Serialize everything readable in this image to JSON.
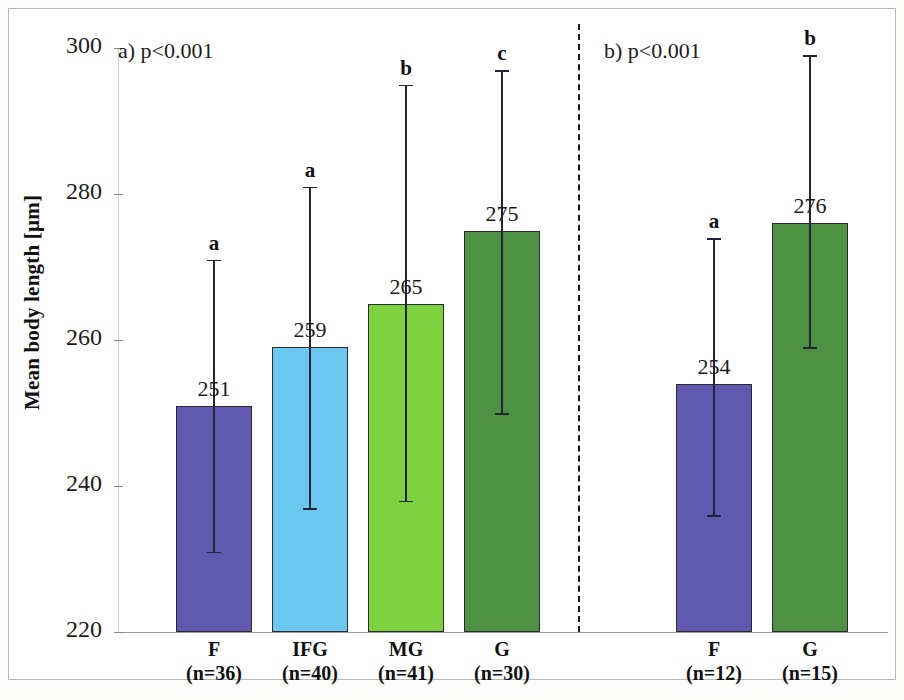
{
  "chart_data": {
    "type": "bar",
    "title": "",
    "xlabel": "",
    "ylabel": "Mean body length [µm]",
    "ylim": [
      220,
      300
    ],
    "yticks": [
      220,
      240,
      260,
      280,
      300
    ],
    "ytick_labels": [
      "220",
      "240",
      "260",
      "280",
      "300"
    ],
    "grid": false,
    "legend": "none",
    "panels": [
      {
        "id": "a",
        "note": "a) p<0.001",
        "categories": [
          "F",
          "IFG",
          "MG",
          "G"
        ],
        "sample_sizes": [
          "(n=36)",
          "(n=40)",
          "(n=41)",
          "(n=30)"
        ],
        "values": [
          251,
          259,
          265,
          275
        ],
        "value_labels": [
          "251",
          "259",
          "265",
          "275"
        ],
        "significance_letters": [
          "a",
          "a",
          "b",
          "c"
        ],
        "error_low": [
          231,
          237,
          238,
          250
        ],
        "error_high": [
          271,
          281,
          295,
          297
        ],
        "colors": [
          "#6159b0",
          "#6cc7f0",
          "#7dd13f",
          "#4e9143"
        ]
      },
      {
        "id": "b",
        "note": "b) p<0.001",
        "categories": [
          "F",
          "G"
        ],
        "sample_sizes": [
          "(n=12)",
          "(n=15)"
        ],
        "values": [
          254,
          276
        ],
        "value_labels": [
          "254",
          "276"
        ],
        "significance_letters": [
          "a",
          "b"
        ],
        "error_low": [
          236,
          259
        ],
        "error_high": [
          274,
          299
        ],
        "colors": [
          "#6159b0",
          "#4e9143"
        ]
      }
    ]
  },
  "axis": {
    "y_label": "Mean body length [µm]",
    "tick_220": "220",
    "tick_240": "240",
    "tick_260": "260",
    "tick_280": "280",
    "tick_300": "300"
  },
  "panel_a": {
    "note": "a) p<0.001",
    "bars": [
      {
        "name": "F",
        "n": "(n=36)",
        "value": "251",
        "letter": "a",
        "color": "#6159b0"
      },
      {
        "name": "IFG",
        "n": "(n=40)",
        "value": "259",
        "letter": "a",
        "color": "#6cc7f0"
      },
      {
        "name": "MG",
        "n": "(n=41)",
        "value": "265",
        "letter": "b",
        "color": "#7dd13f"
      },
      {
        "name": "G",
        "n": "(n=30)",
        "value": "275",
        "letter": "c",
        "color": "#4e9143"
      }
    ]
  },
  "panel_b": {
    "note": "b) p<0.001",
    "bars": [
      {
        "name": "F",
        "n": "(n=12)",
        "value": "254",
        "letter": "a",
        "color": "#6159b0"
      },
      {
        "name": "G",
        "n": "(n=15)",
        "value": "276",
        "letter": "b",
        "color": "#4e9143"
      }
    ]
  }
}
